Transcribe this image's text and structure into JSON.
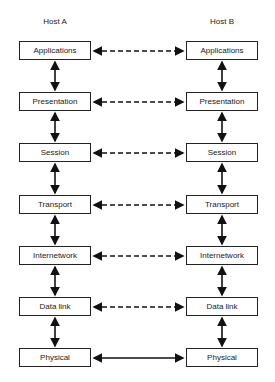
{
  "hosts": {
    "a": "Host A",
    "b": "Host B"
  },
  "layers": [
    "Applications",
    "Presentation",
    "Session",
    "Transport",
    "Internetwork",
    "Data link",
    "Physical"
  ],
  "peer_link_styles": [
    "dashed",
    "dashed",
    "dashed",
    "dashed",
    "dashed",
    "dashed",
    "solid"
  ]
}
